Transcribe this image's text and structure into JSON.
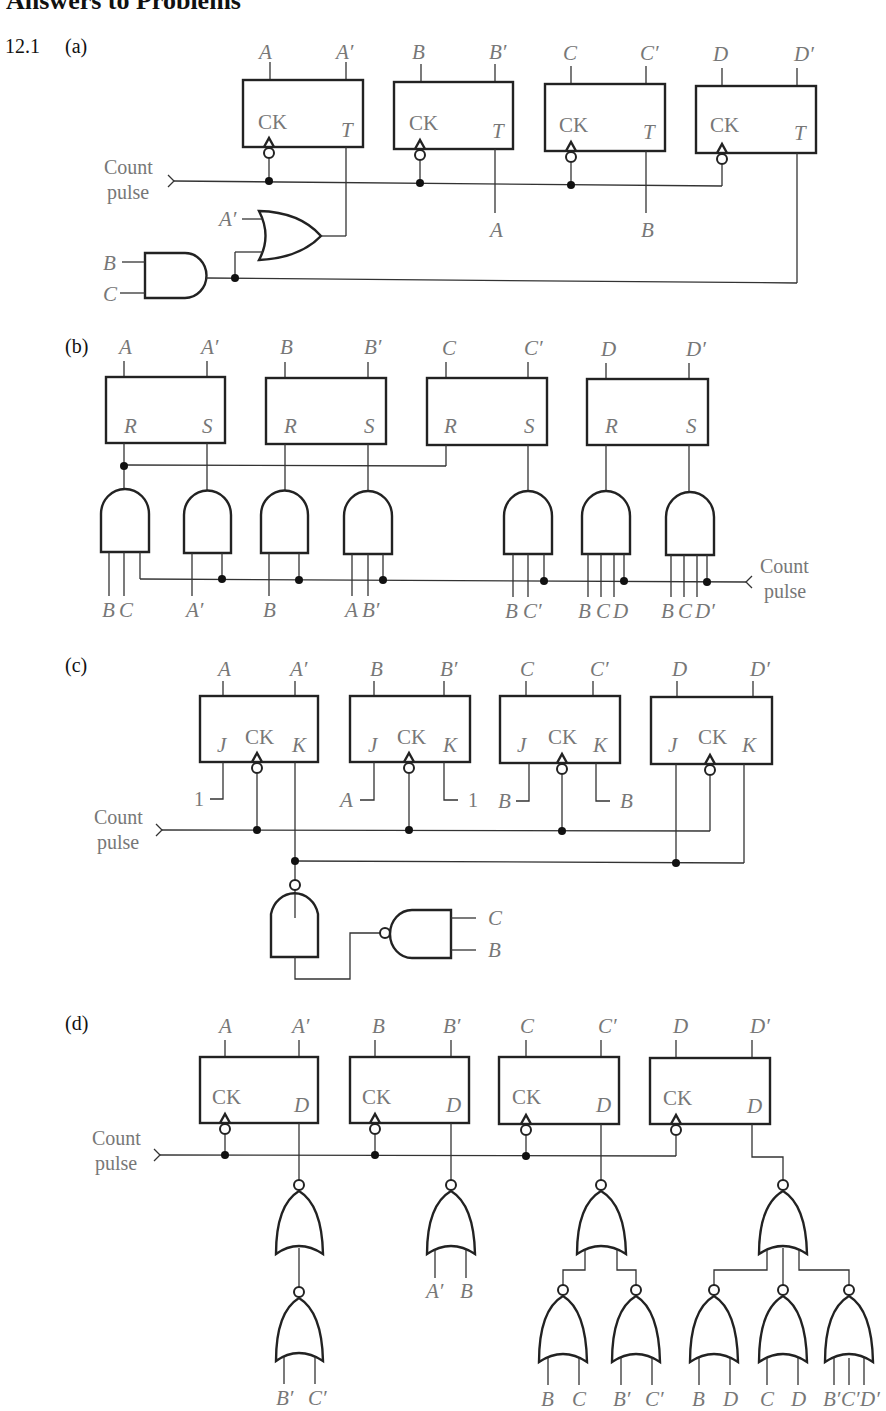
{
  "page": {
    "title": "Answers to Problems",
    "problem_number": "12.1"
  },
  "parts": {
    "a": {
      "label": "(a)",
      "flip_flop_type": "T",
      "input_label": "Count\npulse",
      "count_line1": "Count",
      "count_line2": "pulse",
      "flip_flops": [
        {
          "q": "A",
          "qn": "A′",
          "clock": "CK",
          "input": "T"
        },
        {
          "q": "B",
          "qn": "B′",
          "clock": "CK",
          "input": "T"
        },
        {
          "q": "C",
          "qn": "C′",
          "clock": "CK",
          "input": "T"
        },
        {
          "q": "D",
          "qn": "D′",
          "clock": "CK",
          "input": "T"
        }
      ],
      "t_inputs": {
        "TB": "A",
        "TC": "B"
      },
      "or_gate_input": "A′",
      "and_gate_inputs": [
        "B",
        "C"
      ]
    },
    "b": {
      "label": "(b)",
      "flip_flop_type": "RS",
      "count_line1": "Count",
      "count_line2": "pulse",
      "flip_flops": [
        {
          "q": "A",
          "qn": "A′",
          "r": "R",
          "s": "S"
        },
        {
          "q": "B",
          "qn": "B′",
          "r": "R",
          "s": "S"
        },
        {
          "q": "C",
          "qn": "C′",
          "r": "R",
          "s": "S"
        },
        {
          "q": "D",
          "qn": "D′",
          "r": "R",
          "s": "S"
        }
      ],
      "and_gate_inputs": [
        [
          "B",
          "C"
        ],
        [
          "A′"
        ],
        [
          "B"
        ],
        [
          "A",
          "B′"
        ],
        [
          "B",
          "C′"
        ],
        [
          "B",
          "C",
          "D"
        ],
        [
          "B",
          "C",
          "D′"
        ]
      ]
    },
    "c": {
      "label": "(c)",
      "flip_flop_type": "JK",
      "count_line1": "Count",
      "count_line2": "pulse",
      "flip_flops": [
        {
          "q": "A",
          "qn": "A′",
          "j": "J",
          "clock": "CK",
          "k": "K"
        },
        {
          "q": "B",
          "qn": "B′",
          "j": "J",
          "clock": "CK",
          "k": "K"
        },
        {
          "q": "C",
          "qn": "C′",
          "j": "J",
          "clock": "CK",
          "k": "K"
        },
        {
          "q": "D",
          "qn": "D′",
          "j": "J",
          "clock": "CK",
          "k": "K"
        }
      ],
      "jk_inputs": {
        "JA": "1",
        "JB": "A",
        "KB": "1",
        "JC": "B",
        "KC": "B"
      },
      "nand_inputs": [
        "C",
        "B"
      ]
    },
    "d": {
      "label": "(d)",
      "flip_flop_type": "D",
      "count_line1": "Count",
      "count_line2": "pulse",
      "flip_flops": [
        {
          "q": "A",
          "qn": "A′",
          "clock": "CK",
          "input": "D"
        },
        {
          "q": "B",
          "qn": "B′",
          "clock": "CK",
          "input": "D"
        },
        {
          "q": "C",
          "qn": "C′",
          "clock": "CK",
          "input": "D"
        },
        {
          "q": "D",
          "qn": "D′",
          "clock": "CK",
          "input": "D"
        }
      ],
      "nor_inputs": {
        "DA_inner": [
          "B′",
          "C′"
        ],
        "DB": [
          "A′",
          "B"
        ],
        "DC": [
          [
            "B",
            "C"
          ],
          [
            "B′",
            "C′"
          ]
        ],
        "DD": [
          [
            "B",
            "D"
          ],
          [
            "C",
            "D"
          ],
          [
            "B′",
            "C′",
            "D′"
          ]
        ]
      }
    }
  }
}
